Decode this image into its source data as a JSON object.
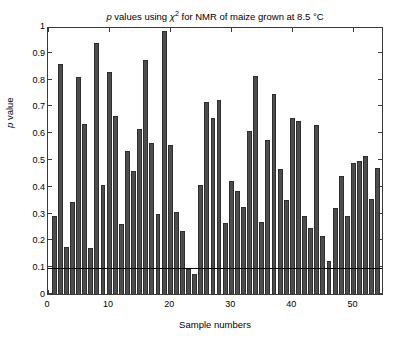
{
  "chart_data": {
    "type": "bar",
    "title_parts": {
      "p": "p",
      "mid": " values using ",
      "chi": "χ",
      "exp": "2",
      "tail": " for NMR of maize grown at 8.5 °C"
    },
    "xlabel": "Sample numbers",
    "ylabel": "p value",
    "ylabel_parts": {
      "p": "p",
      "rest": " value"
    },
    "xlim": [
      0,
      55
    ],
    "ylim": [
      0,
      1
    ],
    "grid": false,
    "legend": null,
    "bar_color": "#4d4d4d",
    "bar_edge_color": "#2e2e2e",
    "axis_color": "#3a3a3a",
    "background": "#ffffff",
    "yticks": [
      0,
      0.1,
      0.2,
      0.3,
      0.4,
      0.5,
      0.6,
      0.7,
      0.8,
      0.9,
      1
    ],
    "ytick_labels": [
      "0",
      "0.1",
      "0.2",
      "0.3",
      "0.4",
      "0.5",
      "0.6",
      "0.7",
      "0.8",
      "0.9",
      "1"
    ],
    "xticks": [
      0,
      10,
      20,
      30,
      40,
      50
    ],
    "xtick_labels": [
      "0",
      "10",
      "20",
      "30",
      "40",
      "50"
    ],
    "threshold": {
      "value": 0.095,
      "label": "significance threshold",
      "color": "#000000",
      "orientation": "horizontal"
    },
    "categories": [
      1,
      2,
      3,
      4,
      5,
      6,
      7,
      8,
      9,
      10,
      11,
      12,
      13,
      14,
      15,
      16,
      17,
      18,
      19,
      20,
      21,
      22,
      23,
      24,
      25,
      26,
      27,
      28,
      29,
      30,
      31,
      32,
      33,
      34,
      35,
      36,
      37,
      38,
      39,
      40,
      41,
      42,
      43,
      44,
      45,
      46,
      47,
      48,
      49,
      50,
      51,
      52,
      53,
      54,
      55
    ],
    "values": [
      0.29,
      0.86,
      0.175,
      0.345,
      0.81,
      0.635,
      0.17,
      0.935,
      0.405,
      0.83,
      0.665,
      0.26,
      0.535,
      0.46,
      0.615,
      0.875,
      0.565,
      0.3,
      0.98,
      0.555,
      0.305,
      0.235,
      0.095,
      0.075,
      0.405,
      0.715,
      0.655,
      0.725,
      0.265,
      0.42,
      0.385,
      0.325,
      0.61,
      0.815,
      0.27,
      0.575,
      0.745,
      0.465,
      0.35,
      0.655,
      0.645,
      0.29,
      0.245,
      0.63,
      0.215,
      0.125,
      0.32,
      0.44,
      0.29,
      0.49,
      0.495,
      0.515,
      0.355,
      0.47,
      0.51
    ]
  }
}
